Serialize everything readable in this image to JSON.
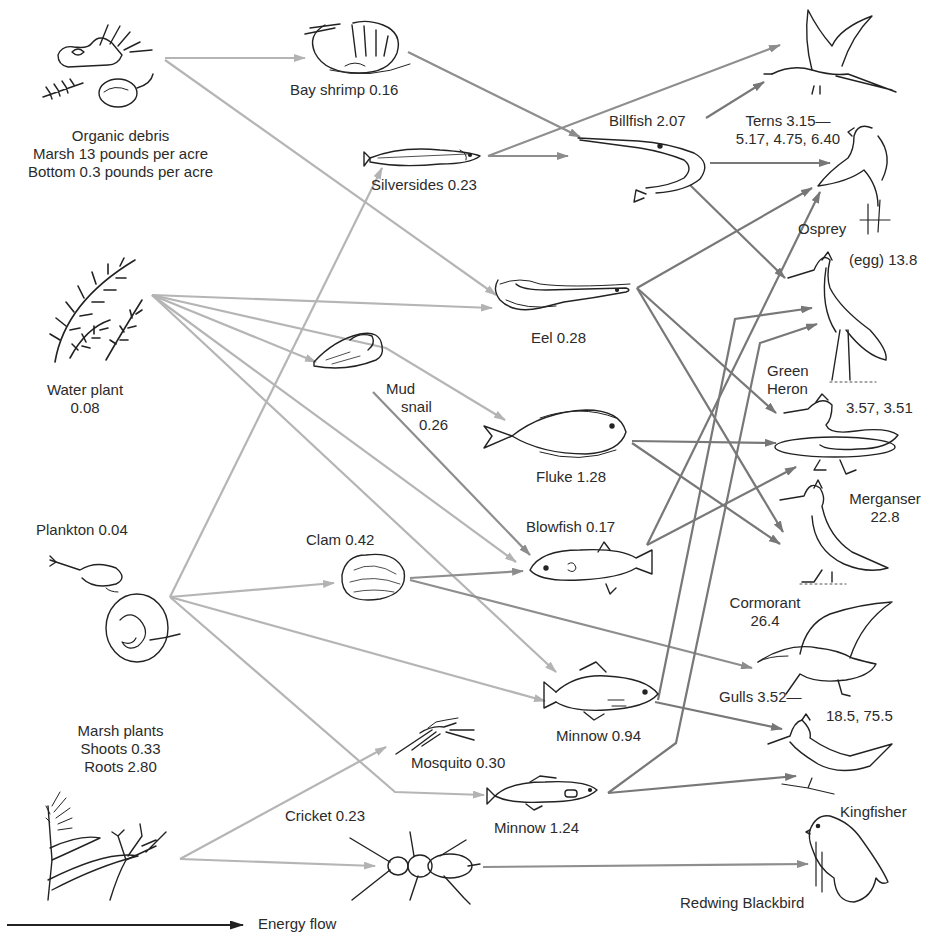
{
  "diagram": {
    "type": "food-web",
    "arrow_colors": {
      "primary": "#b3b3b3",
      "secondary": "#8c8c8c",
      "tertiary": "#767676"
    },
    "legend": {
      "label": "Energy flow"
    }
  },
  "nodes": {
    "organic_debris": {
      "name": "Organic debris",
      "line2": "Marsh 13 pounds per acre",
      "line3": "Bottom 0.3 pounds per acre",
      "icon": "debris-icon"
    },
    "water_plant": {
      "name": "Water plant",
      "value": "0.08",
      "icon": "water-plant-icon"
    },
    "plankton": {
      "label": "Plankton 0.04",
      "icon": "plankton-icon"
    },
    "marsh_plants": {
      "name": "Marsh plants",
      "line2": "Shoots 0.33",
      "line3": "Roots 2.80",
      "icon": "marsh-plant-icon"
    },
    "bay_shrimp": {
      "label": "Bay shrimp 0.16",
      "icon": "shrimp-icon"
    },
    "silversides": {
      "label": "Silversides 0.23",
      "icon": "fish-icon"
    },
    "eel": {
      "label": "Eel 0.28",
      "icon": "eel-icon"
    },
    "mud_snail": {
      "line1": "Mud",
      "line2": "snail",
      "line3": "0.26",
      "icon": "snail-icon"
    },
    "fluke": {
      "label": "Fluke 1.28",
      "icon": "flatfish-icon"
    },
    "clam": {
      "label": "Clam 0.42",
      "icon": "clam-icon"
    },
    "blowfish": {
      "label": "Blowfish 0.17",
      "icon": "blowfish-icon"
    },
    "minnow_094": {
      "label": "Minnow 0.94",
      "icon": "fish-icon"
    },
    "mosquito": {
      "label": "Mosquito 0.30",
      "icon": "mosquito-icon"
    },
    "minnow_124": {
      "label": "Minnow 1.24",
      "icon": "fish-icon"
    },
    "cricket": {
      "label": "Cricket 0.23",
      "icon": "cricket-icon"
    },
    "billfish": {
      "label": "Billfish 2.07",
      "icon": "billfish-icon"
    },
    "terns": {
      "line1": "Terns 3.15—",
      "line2": "5.17, 4.75, 6.40",
      "icon": "tern-icon"
    },
    "osprey": {
      "label": "Osprey",
      "extra": "(egg) 13.8",
      "icon": "osprey-icon"
    },
    "green_heron": {
      "line1": "Green",
      "line2": "Heron",
      "value": "3.57, 3.51",
      "icon": "heron-icon"
    },
    "merganser": {
      "line1": "Merganser",
      "line2": "22.8",
      "icon": "merganser-icon"
    },
    "cormorant": {
      "line1": "Cormorant",
      "line2": "26.4",
      "icon": "cormorant-icon"
    },
    "gulls": {
      "line1": "Gulls 3.52—",
      "line2": "18.5, 75.5",
      "icon": "gull-icon"
    },
    "kingfisher": {
      "label": "Kingfisher",
      "icon": "kingfisher-icon"
    },
    "redwing_blackbird": {
      "label": "Redwing Blackbird",
      "icon": "blackbird-icon"
    }
  },
  "edges": [
    [
      "Organic debris",
      "Bay shrimp"
    ],
    [
      "Organic debris",
      "Eel"
    ],
    [
      "Water plant",
      "Eel"
    ],
    [
      "Water plant",
      "Mud snail"
    ],
    [
      "Water plant",
      "Fluke"
    ],
    [
      "Water plant",
      "Blowfish"
    ],
    [
      "Water plant",
      "Minnow 0.94"
    ],
    [
      "Plankton",
      "Silversides"
    ],
    [
      "Plankton",
      "Clam"
    ],
    [
      "Plankton",
      "Minnow 0.94"
    ],
    [
      "Plankton",
      "Minnow 1.24"
    ],
    [
      "Marsh plants",
      "Mosquito"
    ],
    [
      "Marsh plants",
      "Cricket"
    ],
    [
      "Bay shrimp",
      "Billfish"
    ],
    [
      "Silversides",
      "Billfish"
    ],
    [
      "Silversides",
      "Terns"
    ],
    [
      "Mud snail",
      "Blowfish"
    ],
    [
      "Clam",
      "Blowfish"
    ],
    [
      "Clam",
      "Gulls"
    ],
    [
      "Billfish",
      "Terns"
    ],
    [
      "Billfish",
      "Osprey"
    ],
    [
      "Billfish",
      "Green Heron"
    ],
    [
      "Eel",
      "Osprey"
    ],
    [
      "Eel",
      "Merganser"
    ],
    [
      "Eel",
      "Cormorant"
    ],
    [
      "Fluke",
      "Merganser"
    ],
    [
      "Fluke",
      "Cormorant"
    ],
    [
      "Blowfish",
      "Osprey"
    ],
    [
      "Blowfish",
      "Merganser"
    ],
    [
      "Minnow 0.94",
      "Green Heron"
    ],
    [
      "Minnow 0.94",
      "Kingfisher"
    ],
    [
      "Minnow 1.24",
      "Green Heron"
    ],
    [
      "Minnow 1.24",
      "Kingfisher"
    ],
    [
      "Cricket",
      "Redwing Blackbird"
    ]
  ]
}
